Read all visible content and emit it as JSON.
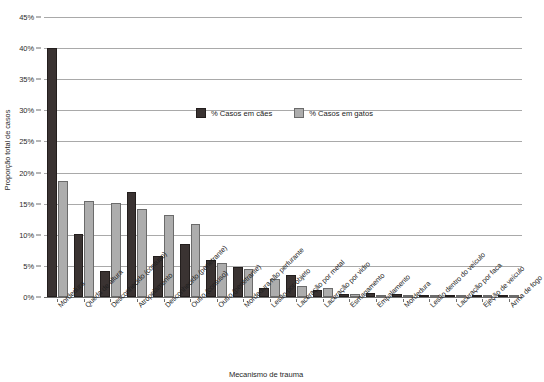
{
  "chart_data": {
    "type": "bar",
    "title": "",
    "xlabel": "Mecanismo de trauma",
    "ylabel": "Proporção total de casos",
    "ylim": [
      0,
      45
    ],
    "ytick_labels": [
      "0%",
      "5%",
      "10%",
      "15%",
      "20%",
      "25%",
      "30%",
      "35%",
      "40%",
      "45%"
    ],
    "ytick_values": [
      0,
      5,
      10,
      15,
      20,
      25,
      30,
      35,
      40,
      45
    ],
    "grid": true,
    "legend_position": "upper-center",
    "categories": [
      "Mordedura",
      "Queda de altura",
      "Desconhecido (contuso)",
      "Atropelamento",
      "Desconhecido (penetrante)",
      "Outro (contuso)",
      "Outro (penetrante)",
      "Mordedura não perfurante",
      "Lesão por objeto",
      "Laceração por metal",
      "Laceração por vidro",
      "Esmagamento",
      "Empalamento",
      "Mordedura",
      "Lesão dentro do veículo",
      "Laceração por faca",
      "Ejeção de veículo",
      "Arma de fogo"
    ],
    "series": [
      {
        "name": "% Casos em cães",
        "color": "#3a3332",
        "values": [
          40.0,
          10.2,
          4.2,
          16.8,
          6.6,
          8.6,
          6.0,
          4.9,
          1.4,
          3.6,
          1.1,
          0.5,
          0.7,
          0.5,
          0.35,
          0.3,
          0.3,
          0.25
        ]
      },
      {
        "name": "% Casos em gatos",
        "color": "#adadad",
        "values": [
          18.7,
          15.4,
          15.1,
          14.1,
          13.2,
          11.7,
          5.4,
          4.5,
          2.9,
          1.7,
          1.5,
          0.5,
          0.4,
          0.2,
          0.2,
          0.15,
          0.15,
          0.1
        ]
      }
    ]
  },
  "legend": {
    "items": [
      {
        "label": "% Casos em cães"
      },
      {
        "label": "% Casos em gatos"
      }
    ]
  },
  "axes": {
    "y_title": "Proporção total de casos",
    "x_title": "Mecanismo de trauma"
  }
}
